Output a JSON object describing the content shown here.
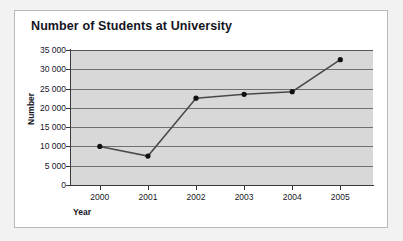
{
  "card": {
    "title": "Number of Students at University"
  },
  "chart_data": {
    "type": "line",
    "title": "Number of Students at University",
    "xlabel": "Year",
    "ylabel": "Number",
    "categories": [
      "2000",
      "2001",
      "2002",
      "2003",
      "2004",
      "2005"
    ],
    "values": [
      10000,
      7500,
      22500,
      23500,
      24200,
      32500
    ],
    "series": [
      {
        "name": "Number of Students",
        "values": [
          10000,
          7500,
          22500,
          23500,
          24200,
          32500
        ]
      }
    ],
    "ylim": [
      0,
      35000
    ],
    "ytick_labels": [
      "35 000",
      "30 000",
      "25 000",
      "20 000",
      "15 000",
      "10 000",
      "5 000",
      "0"
    ],
    "ytick_values": [
      35000,
      30000,
      25000,
      20000,
      15000,
      10000,
      5000,
      0
    ],
    "xtick_labels": [
      "2000",
      "2001",
      "2002",
      "2003",
      "2004",
      "2005"
    ],
    "grid": true,
    "legend": "none",
    "marker": "circle",
    "colors": {
      "plot_background": "#d8d8d8",
      "gridline": "#6f6f6f",
      "axis": "#3a3a3a",
      "line": "#4a4a4a",
      "marker": "#111111",
      "title_text": "#15151f",
      "card_background": "#ffffff",
      "page_background": "#f2f2f2",
      "card_border": "#b9b9b9"
    }
  }
}
